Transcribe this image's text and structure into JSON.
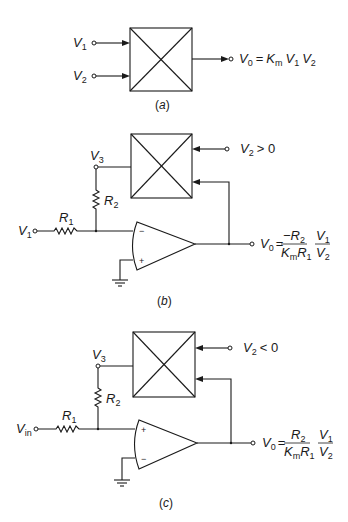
{
  "diagram": {
    "panel_a": {
      "caption_letter": "a",
      "inputs": [
        {
          "name": "V",
          "sub": "1"
        },
        {
          "name": "V",
          "sub": "2"
        }
      ],
      "block": "multiplier",
      "output": {
        "lhs": "V",
        "lhs_sub": "0",
        "eq": "=",
        "k": "K",
        "k_sub": "m",
        "f1": "V",
        "f1_sub": "1",
        "f2": "V",
        "f2_sub": "2"
      }
    },
    "panel_b": {
      "caption_letter": "b",
      "input": {
        "name": "V",
        "sub": "1"
      },
      "r1": {
        "name": "R",
        "sub": "1"
      },
      "r2": {
        "name": "R",
        "sub": "2"
      },
      "node": {
        "name": "V",
        "sub": "3"
      },
      "v2_condition": {
        "name": "V",
        "sub": "2",
        "rel": "> 0"
      },
      "opamp_inverting_sign": "−",
      "opamp_noninverting_sign": "+",
      "output": {
        "lhs": "V",
        "lhs_sub": "0",
        "eq": "=",
        "num": "−R",
        "num_sub": "2",
        "den_k": "K",
        "den_k_sub": "m",
        "den_r": "R",
        "den_r_sub": "1",
        "frac_num": "V",
        "frac_num_sub": "1",
        "frac_den": "V",
        "frac_den_sub": "2"
      }
    },
    "panel_c": {
      "caption_letter": "c",
      "input": {
        "name": "V",
        "sub": "in"
      },
      "r1": {
        "name": "R",
        "sub": "1"
      },
      "r2": {
        "name": "R",
        "sub": "2"
      },
      "node": {
        "name": "V",
        "sub": "3"
      },
      "v2_condition": {
        "name": "V",
        "sub": "2",
        "rel": "< 0"
      },
      "opamp_top_sign": "+",
      "opamp_bottom_sign": "−",
      "output": {
        "lhs": "V",
        "lhs_sub": "0",
        "eq": "=",
        "num": "R",
        "num_sub": "2",
        "den_k": "K",
        "den_k_sub": "m",
        "den_r": "R",
        "den_r_sub": "1",
        "frac_num": "V",
        "frac_num_sub": "1",
        "frac_den": "V",
        "frac_den_sub": "2"
      }
    },
    "colors": {
      "ink": "#1a1a1a",
      "background": "#ffffff"
    }
  }
}
